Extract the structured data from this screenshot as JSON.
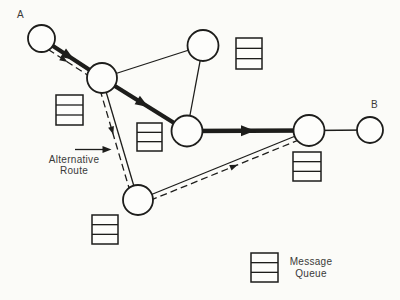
{
  "canvas": {
    "width": 400,
    "height": 300,
    "background": "#fbfbf8",
    "ink": "#1d1d1b",
    "node_fill": "#fdfdfb",
    "text_color": "#3a3a38"
  },
  "texts": {
    "endpoint_a": "A",
    "endpoint_b": "B",
    "alternative_route_line1": "Alternative",
    "alternative_route_line2": "Route",
    "legend_line1": "Message",
    "legend_line2": "Queue"
  },
  "diagram": {
    "nodes": [
      {
        "id": "node-a",
        "cx": 41.5,
        "cy": 38.5,
        "r": 13.5
      },
      {
        "id": "node-upper-left",
        "cx": 102,
        "cy": 78,
        "r": 15
      },
      {
        "id": "node-top",
        "cx": 203,
        "cy": 45.5,
        "r": 15.5
      },
      {
        "id": "node-center",
        "cx": 187,
        "cy": 131,
        "r": 15.5
      },
      {
        "id": "node-bottom",
        "cx": 138,
        "cy": 200,
        "r": 15
      },
      {
        "id": "node-right",
        "cx": 309,
        "cy": 130.5,
        "r": 15.5
      },
      {
        "id": "node-b",
        "cx": 370,
        "cy": 130,
        "r": 13
      }
    ],
    "edges": [
      {
        "id": "link-upperleft-top",
        "style": "thin",
        "x1": 102,
        "y1": 78,
        "x2": 203,
        "y2": 45.5
      },
      {
        "id": "link-top-center",
        "style": "thin",
        "x1": 203,
        "y1": 45.5,
        "x2": 187,
        "y2": 131
      },
      {
        "id": "link-upperleft-bottom",
        "style": "thin",
        "x1": 102,
        "y1": 78,
        "x2": 138,
        "y2": 200
      },
      {
        "id": "link-bottom-right",
        "style": "thin",
        "x1": 138,
        "y1": 200,
        "x2": 309,
        "y2": 130.5
      },
      {
        "id": "link-right-b",
        "style": "thin",
        "x1": 309,
        "y1": 130.5,
        "x2": 370,
        "y2": 130
      },
      {
        "id": "primary-route-a-upperleft",
        "style": "thick",
        "x1": 41.5,
        "y1": 38.5,
        "x2": 102,
        "y2": 78,
        "arrow": {
          "t": 0.45,
          "len": 13,
          "wid": 10
        }
      },
      {
        "id": "primary-route-upperleft-center",
        "style": "thick",
        "x1": 102,
        "y1": 78,
        "x2": 187,
        "y2": 131,
        "arrow": {
          "t": 0.48,
          "len": 13,
          "wid": 10
        }
      },
      {
        "id": "primary-route-center-right",
        "style": "thick",
        "x1": 187,
        "y1": 131,
        "x2": 309,
        "y2": 130.5,
        "arrow": {
          "t": 0.5,
          "len": 14,
          "wid": 11
        }
      },
      {
        "id": "alt-route-a-upperleft",
        "style": "dashed",
        "x1": 39,
        "y1": 43.5,
        "x2": 99,
        "y2": 82.5,
        "arrow": {
          "t": 0.42,
          "len": 8,
          "wid": 6
        }
      },
      {
        "id": "alt-route-upperleft-bottom",
        "style": "dashed",
        "x1": 97,
        "y1": 79.5,
        "x2": 133,
        "y2": 201.5,
        "arrow": {
          "t": 0.42,
          "len": 8,
          "wid": 6
        }
      },
      {
        "id": "alt-route-bottom-right",
        "style": "dashed",
        "x1": 140,
        "y1": 204.5,
        "x2": 311,
        "y2": 135,
        "arrow": {
          "t": 0.55,
          "len": 8,
          "wid": 6
        }
      },
      {
        "id": "alternative-route-pointer-arrow",
        "style": "thin",
        "x1": 75,
        "y1": 149.5,
        "x2": 107,
        "y2": 149.5,
        "arrow": {
          "t": 1,
          "len": 9,
          "wid": 7
        }
      }
    ],
    "queues": [
      {
        "id": "queue-upper-left",
        "x": 56,
        "y": 95,
        "w": 27,
        "h": 30,
        "rows": 3
      },
      {
        "id": "queue-top",
        "x": 236,
        "y": 38,
        "w": 26,
        "h": 31,
        "rows": 3
      },
      {
        "id": "queue-center",
        "x": 137,
        "y": 123,
        "w": 25,
        "h": 28,
        "rows": 3
      },
      {
        "id": "queue-bottom-left",
        "x": 92,
        "y": 215,
        "w": 26,
        "h": 29,
        "rows": 3
      },
      {
        "id": "queue-right",
        "x": 293,
        "y": 152,
        "w": 28,
        "h": 29,
        "rows": 3
      },
      {
        "id": "queue-legend",
        "x": 251,
        "y": 253,
        "w": 27,
        "h": 29,
        "rows": 3
      }
    ]
  }
}
